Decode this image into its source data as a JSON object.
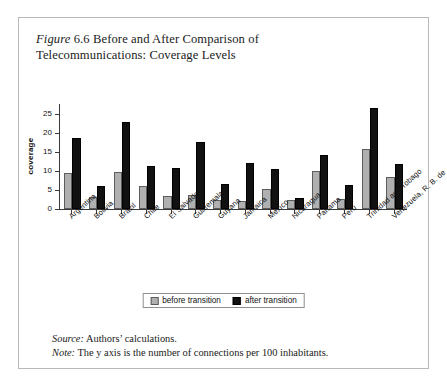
{
  "figure": {
    "label_italic": "Figure",
    "number": "6.6",
    "title_rest": "Before and After Comparison of Telecommunications: Coverage Levels",
    "title_line1": "Before and After Comparison of",
    "title_line2": "Telecommunications: Coverage Levels"
  },
  "footnotes": {
    "source_lead": "Source:",
    "source_text": "Authors’ calculations.",
    "note_lead": "Note:",
    "note_text": "The y axis is the number of connections per 100 inhabitants."
  },
  "legend": {
    "before_label": "before transition",
    "after_label": "after transition",
    "before_color": "#b0b0b0",
    "after_color": "#111111"
  },
  "chart_data": {
    "type": "bar",
    "title": "Figure 6.6 Before and After Comparison of Telecommunications: Coverage Levels",
    "xlabel": "",
    "ylabel": "coverage",
    "ylim": [
      0,
      27.5
    ],
    "yticks": [
      0,
      5,
      10,
      15,
      20,
      25
    ],
    "ytick_labels": [
      "0",
      "5",
      "10",
      "15",
      "20",
      "25"
    ],
    "grid": false,
    "legend_position": "bottom-center",
    "categories": [
      "Argentina",
      "Bolivia",
      "Brazil",
      "Chile",
      "El Salvador",
      "Guatemala",
      "Guyana",
      "Jamaica",
      "Mexico",
      "Nicaragua",
      "Panama",
      "Peru",
      "Trinidad and Tobago",
      "Venezuela, R. B. de"
    ],
    "series": [
      {
        "name": "before transition",
        "color": "#b0b0b0",
        "values": [
          9.5,
          3.1,
          9.8,
          6.0,
          3.4,
          3.6,
          2.3,
          2.2,
          5.3,
          2.3,
          10.0,
          2.6,
          15.8,
          8.3
        ]
      },
      {
        "name": "after transition",
        "color": "#111111",
        "values": [
          18.5,
          6.1,
          22.7,
          11.2,
          10.8,
          17.6,
          6.6,
          12.0,
          10.6,
          3.0,
          14.2,
          6.3,
          26.5,
          11.7
        ]
      }
    ],
    "note": "The y axis is the number of connections per 100 inhabitants.",
    "source": "Authors’ calculations."
  }
}
